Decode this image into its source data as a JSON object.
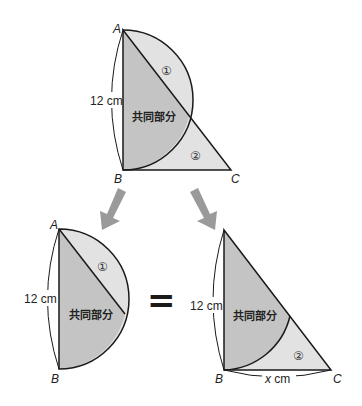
{
  "labels": {
    "A": "A",
    "B": "B",
    "C": "C",
    "side_ab": "12 cm",
    "side_bc": "x cm",
    "x_var": "x",
    "cm": "cm",
    "common": "共同部分",
    "region1": "①",
    "region2": "②",
    "equals": "="
  },
  "colors": {
    "common_fill": "#c8c8c8",
    "region_fill": "#e2e2e2",
    "stroke": "#1a1a1a",
    "arrow": "#9a9a9a"
  }
}
